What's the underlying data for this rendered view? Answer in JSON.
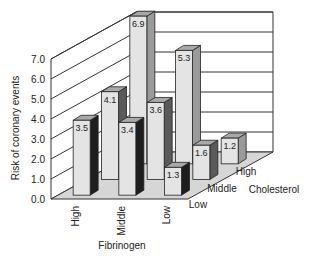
{
  "chart_data": {
    "type": "bar",
    "subtype": "3d-grouped-bar",
    "title": "",
    "ylabel": "Risk of coronary events",
    "xlabel": "Fibrinogen",
    "zlabel": "Cholesterol",
    "ylim": [
      0,
      7
    ],
    "yticks": [
      "0.0",
      "1.0",
      "2.0",
      "3.0",
      "4.0",
      "5.0",
      "6.0",
      "7.0"
    ],
    "grid": true,
    "categories": [
      "High",
      "Middle",
      "Low"
    ],
    "depth_categories": [
      "Low",
      "Middle",
      "High"
    ],
    "series": [
      {
        "name": "Low",
        "values": [
          3.5,
          3.4,
          1.3
        ],
        "labels": [
          "3.5",
          "3.4",
          "1.3"
        ]
      },
      {
        "name": "Middle",
        "values": [
          4.1,
          3.6,
          1.6
        ],
        "labels": [
          "4.1",
          "3.6",
          "1.6"
        ]
      },
      {
        "name": "High",
        "values": [
          6.9,
          5.3,
          1.2
        ],
        "labels": [
          "6.9",
          "5.3",
          "1.2"
        ]
      }
    ],
    "colors": {
      "bar_front": "#e4e4e4",
      "bar_top": "#a8a8a8",
      "bar_side_by_series": [
        "#1e1e1e",
        "#5a5a5a",
        "#9a9a9a"
      ],
      "floor": "#d6d6d6",
      "wall": "#ffffff",
      "line": "#333333"
    }
  }
}
